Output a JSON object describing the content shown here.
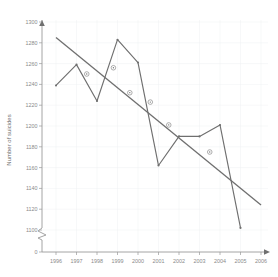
{
  "chart_data": {
    "type": "line",
    "title": "",
    "xlabel": "",
    "ylabel": "Number of suicides",
    "xlim": [
      1995.5,
      2006.5
    ],
    "ylim": [
      1090,
      1305
    ],
    "ylim_display": [
      0,
      1300
    ],
    "grid": true,
    "legend": "none",
    "axis_break": true,
    "axis_break_note": "y-axis broken between 0 and 1100",
    "x": [
      1996,
      1997,
      1998,
      1999,
      2000,
      2001,
      2002,
      2003,
      2004,
      2005
    ],
    "series": [
      {
        "name": "Number of suicides",
        "values": [
          1239,
          1259,
          1224,
          1283,
          1261,
          1162,
          1190,
          1190,
          1201,
          1102
        ]
      }
    ],
    "trendline": {
      "name": "Linear trend",
      "x": [
        1996,
        2006
      ],
      "values": [
        1285,
        1124
      ],
      "marker_x": [
        1997.5,
        1998.8,
        1999.6,
        2000.6,
        2001.5,
        2003.5
      ],
      "marker_values": [
        1250,
        1256,
        1232,
        1223,
        1201,
        1175
      ]
    },
    "yticks": [
      0,
      1100,
      1120,
      1140,
      1160,
      1180,
      1200,
      1220,
      1240,
      1260,
      1280,
      1300
    ],
    "ytick_labels": [
      "0",
      "1100",
      "1120",
      "1140",
      "1160",
      "1180",
      "1200",
      "1220",
      "1240",
      "1260",
      "1280",
      "1300"
    ],
    "xticks": [
      1996,
      1997,
      1998,
      1999,
      2000,
      2001,
      2002,
      2003,
      2004,
      2005,
      2006
    ],
    "xtick_labels": [
      "1996",
      "1997",
      "1998",
      "1999",
      "2000",
      "2001",
      "2002",
      "2003",
      "2004",
      "2005",
      "2006"
    ]
  }
}
